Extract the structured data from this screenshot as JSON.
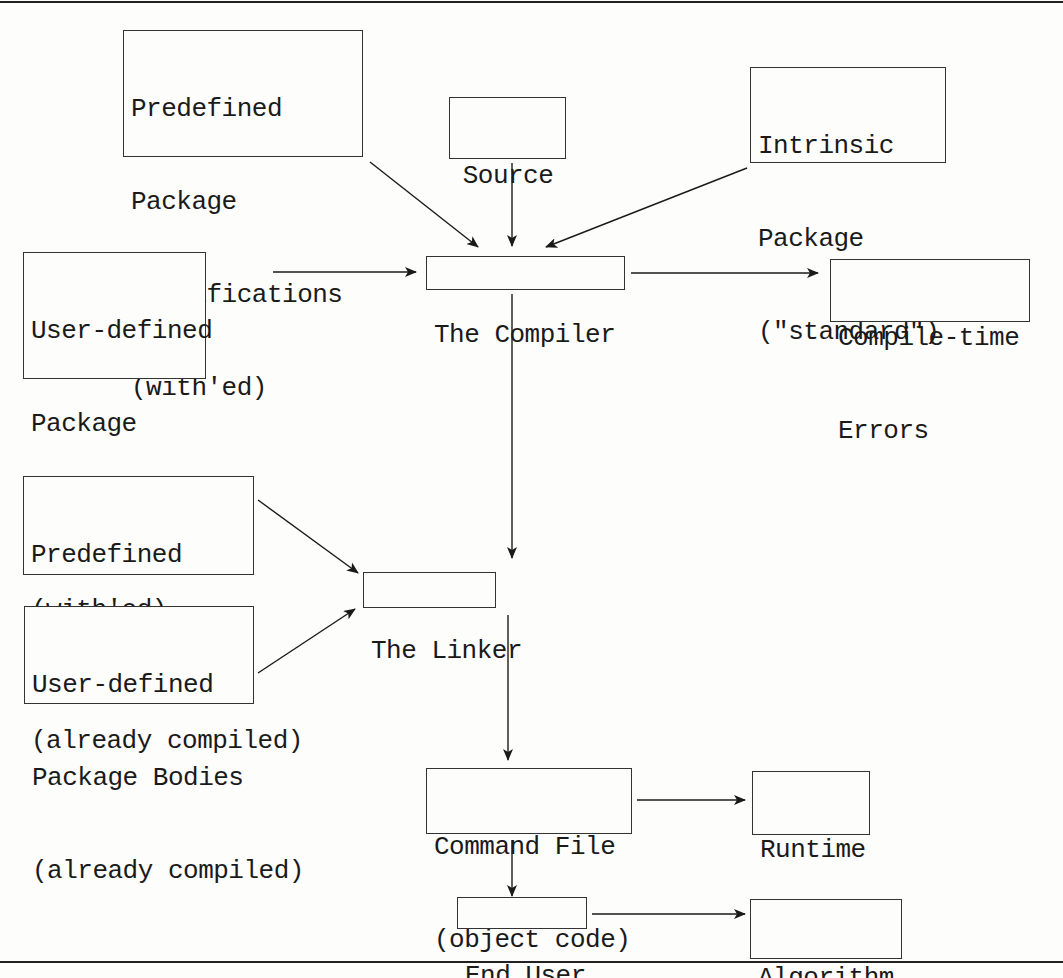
{
  "diagram": {
    "type": "flowchart",
    "nodes": {
      "predef_specs": {
        "lines": [
          "Predefined",
          "Package",
          "Specifications",
          "(with'ed)"
        ]
      },
      "source_code": {
        "lines": [
          "Source",
          "Code"
        ]
      },
      "intrinsic": {
        "lines": [
          "Intrinsic",
          "Package",
          "(\"standard\")"
        ]
      },
      "user_specs": {
        "lines": [
          "User-defined",
          "Package",
          "Specifications",
          "(with'ed)"
        ]
      },
      "compiler": {
        "lines": [
          "The Compiler"
        ]
      },
      "compile_errors": {
        "lines": [
          "Compile-time",
          "Errors"
        ]
      },
      "predef_bodies": {
        "lines": [
          "Predefined",
          "Package Bodies",
          "(already compiled)"
        ]
      },
      "user_bodies": {
        "lines": [
          "User-defined",
          "Package Bodies",
          "(already compiled)"
        ]
      },
      "linker": {
        "lines": [
          "The Linker"
        ]
      },
      "command_file": {
        "lines": [
          "Command File",
          "(object code)"
        ]
      },
      "runtime_errors": {
        "lines": [
          "Runtime",
          "Errors"
        ]
      },
      "end_user": {
        "lines": [
          "End User"
        ]
      },
      "algorithm_errors": {
        "lines": [
          "Algorithm",
          "Errors"
        ]
      }
    },
    "edges": [
      {
        "from": "predef_specs",
        "to": "compiler"
      },
      {
        "from": "source_code",
        "to": "compiler"
      },
      {
        "from": "intrinsic",
        "to": "compiler"
      },
      {
        "from": "user_specs",
        "to": "compiler"
      },
      {
        "from": "compiler",
        "to": "compile_errors"
      },
      {
        "from": "compiler",
        "to": "linker"
      },
      {
        "from": "predef_bodies",
        "to": "linker"
      },
      {
        "from": "user_bodies",
        "to": "linker"
      },
      {
        "from": "linker",
        "to": "command_file"
      },
      {
        "from": "command_file",
        "to": "runtime_errors"
      },
      {
        "from": "command_file",
        "to": "end_user"
      },
      {
        "from": "end_user",
        "to": "algorithm_errors"
      }
    ],
    "colors": {
      "ink": "#1a1a1a",
      "paper": "#fdfdfb"
    }
  }
}
